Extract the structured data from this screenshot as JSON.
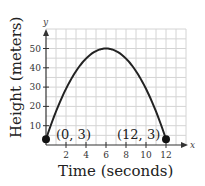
{
  "chart_data": {
    "type": "line",
    "title": "",
    "xlabel": "Time (seconds)",
    "ylabel": "Height (meters)",
    "x_axis_var": "x",
    "y_axis_var": "y",
    "xlim": [
      0,
      13
    ],
    "ylim": [
      0,
      56
    ],
    "x_ticks": [
      2,
      4,
      6,
      8,
      10,
      12
    ],
    "y_ticks": [
      10,
      20,
      30,
      40,
      50
    ],
    "x_tick_labels": [
      "2",
      "4",
      "6",
      "8",
      "10",
      "12"
    ],
    "y_tick_labels": [
      "10",
      "20",
      "30",
      "40",
      "50"
    ],
    "grid": true,
    "series": [
      {
        "name": "height",
        "shape": "parabola",
        "vertex": [
          6,
          50
        ],
        "x": [
          0,
          1,
          2,
          3,
          4,
          5,
          6,
          7,
          8,
          9,
          10,
          11,
          12
        ],
        "y": [
          3,
          17.4,
          29.1,
          38.3,
          44.8,
          48.7,
          50,
          48.7,
          44.8,
          38.3,
          29.1,
          17.4,
          3
        ]
      }
    ],
    "points": [
      {
        "x": 0,
        "y": 3,
        "label": "(0, 3)"
      },
      {
        "x": 12,
        "y": 3,
        "label": "(12, 3)"
      }
    ]
  },
  "labels": {
    "xlabel": "Time (seconds)",
    "ylabel": "Height (meters)",
    "x_var": "x",
    "y_var": "y",
    "point_start": "(0, 3)",
    "point_end": "(12, 3)"
  }
}
